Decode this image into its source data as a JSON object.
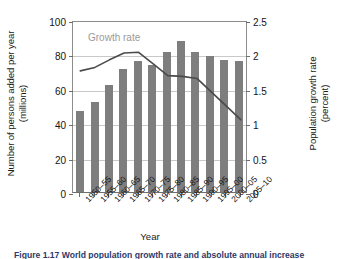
{
  "chart_data": {
    "type": "bar",
    "title": "",
    "xlabel": "Year",
    "ylabel": "Number of persons added per year (millions)",
    "ylabel_right": "Population growth rate (percent)",
    "categories": [
      "1950–55",
      "1955–60",
      "1960–65",
      "1965–70",
      "1970–75",
      "1975–80",
      "1980–85",
      "1985–90",
      "1990–95",
      "1995–00",
      "2000–05",
      "2005–10"
    ],
    "ylim": [
      0,
      100
    ],
    "yticks": [
      "0",
      "20",
      "40",
      "60",
      "80",
      "100"
    ],
    "ytick_values": [
      0,
      20,
      40,
      60,
      80,
      100
    ],
    "ylim_right": [
      0,
      2.5
    ],
    "yticks_right": [
      "0",
      "0.5",
      "1",
      "1.5",
      "2",
      "2.5"
    ],
    "ytick_values_right": [
      0,
      0.5,
      1,
      1.5,
      2,
      2.5
    ],
    "grid": true,
    "grid_axis": "y",
    "legend_position": "inside-upper-left",
    "series": [
      {
        "name": "Number of persons added per year",
        "type": "bar",
        "axis": "left",
        "unit": "millions",
        "color": "#7e7e7e",
        "values": [
          47,
          52.5,
          62.5,
          71.5,
          76,
          74,
          81.5,
          88,
          81.5,
          79,
          77,
          76
        ]
      },
      {
        "name": "Growth rate",
        "type": "line",
        "axis": "right",
        "unit": "percent",
        "color": "#4a4a4a",
        "label_color": "#9a9a9a",
        "values": [
          1.79,
          1.84,
          1.95,
          2.05,
          2.06,
          1.89,
          1.72,
          1.71,
          1.68,
          1.48,
          1.28,
          1.08
        ]
      }
    ],
    "annotations": [
      {
        "text": "Growth rate",
        "target_series": "Growth rate",
        "color": "#9a9a9a"
      }
    ]
  },
  "axes": {
    "x_title": "Year",
    "y_left_title_line1": "Number of persons added per year",
    "y_left_title_line2": "(millions)",
    "y_right_title_line1": "Population growth rate",
    "y_right_title_line2": "(percent)"
  },
  "caption": {
    "text": "Figure 1.17 World population growth rate and absolute annual increase"
  },
  "colors": {
    "bar": "#7e7e7e",
    "line": "#4a4a4a",
    "grid": "#c9c9c9",
    "axis": "#6e6e6e",
    "text": "#141414",
    "annotation": "#9a9a9a",
    "caption": "#2b3a6b",
    "background": "#ffffff"
  }
}
